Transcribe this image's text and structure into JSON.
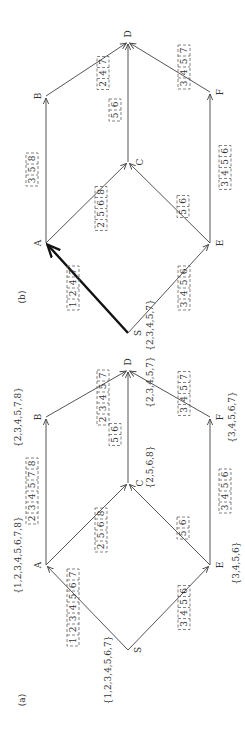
{
  "panels": [
    {
      "id": "b",
      "caption": "(b)",
      "nodes": [
        {
          "name": "S",
          "x": 128,
          "y": 333
        },
        {
          "name": "A",
          "x": 46,
          "y": 243
        },
        {
          "name": "E",
          "x": 210,
          "y": 243
        },
        {
          "name": "B",
          "x": 46,
          "y": 96
        },
        {
          "name": "C",
          "x": 128,
          "y": 162
        },
        {
          "name": "F",
          "x": 210,
          "y": 92
        },
        {
          "name": "D",
          "x": 128,
          "y": 42
        }
      ],
      "node_sets": [
        {
          "node": "S",
          "text": "{2,3,4,5,7}"
        }
      ],
      "edges": [
        {
          "from": "S",
          "to": "A",
          "labels": [
            "1",
            "2",
            "4",
            "7"
          ],
          "bold": true
        },
        {
          "from": "S",
          "to": "E",
          "labels": [
            "3",
            "4",
            "5",
            "6"
          ],
          "bold": false
        },
        {
          "from": "A",
          "to": "B",
          "labels": [
            "3",
            "5",
            "8"
          ],
          "bold": false
        },
        {
          "from": "A",
          "to": "C",
          "labels": [
            "2",
            "5",
            "6",
            "8"
          ],
          "bold": false
        },
        {
          "from": "E",
          "to": "C",
          "labels": [
            "5",
            "6"
          ],
          "bold": false
        },
        {
          "from": "E",
          "to": "F",
          "labels": [
            "3",
            "4",
            "5",
            "6"
          ],
          "bold": false
        },
        {
          "from": "B",
          "to": "D",
          "labels": [
            "2",
            "4",
            "7"
          ],
          "bold": false
        },
        {
          "from": "C",
          "to": "D",
          "labels": [
            "5",
            "6"
          ],
          "bold": false
        },
        {
          "from": "F",
          "to": "D",
          "labels": [
            "3",
            "4",
            "5",
            "7"
          ],
          "bold": false
        }
      ]
    },
    {
      "id": "a",
      "caption": "(a)",
      "nodes": [
        {
          "name": "S",
          "x": 128,
          "y": 650
        },
        {
          "name": "A",
          "x": 46,
          "y": 565
        },
        {
          "name": "E",
          "x": 210,
          "y": 565
        },
        {
          "name": "B",
          "x": 46,
          "y": 417
        },
        {
          "name": "C",
          "x": 128,
          "y": 483
        },
        {
          "name": "F",
          "x": 210,
          "y": 417
        },
        {
          "name": "D",
          "x": 128,
          "y": 370
        }
      ],
      "node_sets": [
        {
          "node": "S",
          "text": "{1,2,3,4,5,6,7}"
        },
        {
          "node": "A",
          "text": "{1,2,3,4,5,6,7,8}"
        },
        {
          "node": "B",
          "text": "{2,3,4,5,7,8}"
        },
        {
          "node": "C",
          "text": "{2,5,6,8}"
        },
        {
          "node": "D",
          "text": "{2,3,4,5,7}"
        },
        {
          "node": "E",
          "text": "{3,4,5,6}"
        },
        {
          "node": "F",
          "text": "{3,4,5,6,7}"
        }
      ],
      "edges": [
        {
          "from": "S",
          "to": "A",
          "labels": [
            "1",
            "2",
            "3",
            "4",
            "5",
            "6",
            "7"
          ],
          "bold": false
        },
        {
          "from": "S",
          "to": "E",
          "labels": [
            "3",
            "4",
            "5",
            "6"
          ],
          "bold": false
        },
        {
          "from": "A",
          "to": "B",
          "labels": [
            "2",
            "3",
            "4",
            "5",
            "7",
            "8"
          ],
          "bold": false
        },
        {
          "from": "A",
          "to": "C",
          "labels": [
            "2",
            "5",
            "6",
            "8"
          ],
          "bold": false
        },
        {
          "from": "E",
          "to": "C",
          "labels": [
            "5",
            "6"
          ],
          "bold": false
        },
        {
          "from": "E",
          "to": "F",
          "labels": [
            "3",
            "4",
            "5",
            "6"
          ],
          "bold": false
        },
        {
          "from": "B",
          "to": "D",
          "labels": [
            "2",
            "3",
            "4",
            "5",
            "7"
          ],
          "bold": false
        },
        {
          "from": "C",
          "to": "D",
          "labels": [
            "5",
            "6"
          ],
          "bold": false
        },
        {
          "from": "F",
          "to": "D",
          "labels": [
            "3",
            "4",
            "5",
            "7"
          ],
          "bold": false
        }
      ]
    }
  ]
}
